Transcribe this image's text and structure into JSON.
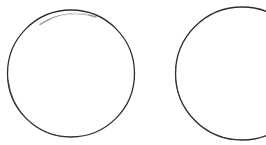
{
  "canvas": {
    "width": 266,
    "height": 145,
    "background_color": "#ffffff",
    "description": "Two hand-drawn circle outlines on a plain white background; the right circle is cropped by the right edge of the image."
  },
  "style": {
    "stroke_color": "#2e2e30",
    "stroke_color_faint": "#8d8d90",
    "stroke_width": 1.3,
    "stroke_width_faint": 0.9,
    "fill": "none"
  },
  "shapes": [
    {
      "name": "circle-left",
      "type": "circle",
      "cx": 71,
      "cy": 73.5,
      "r": 63.5,
      "clipped": false,
      "bounds": {
        "left": 7.5,
        "top": 10,
        "right": 134.5,
        "bottom": 137
      },
      "stroke_color": "#2e2e30",
      "stroke_width": 1.3
    },
    {
      "name": "circle-right",
      "type": "circle",
      "cx": 242,
      "cy": 73.5,
      "r": 66.5,
      "clipped": true,
      "clipped_edge": "right",
      "bounds": {
        "left": 175.5,
        "top": 7,
        "right": 308.5,
        "bottom": 140
      },
      "stroke_color": "#2e2e30",
      "stroke_width": 1.3
    }
  ],
  "annotations": {
    "faded_arc_note": "Top arc of the left circle is lighter/thinner than the rest of its outline.",
    "label_count": 0,
    "text_content": ""
  }
}
